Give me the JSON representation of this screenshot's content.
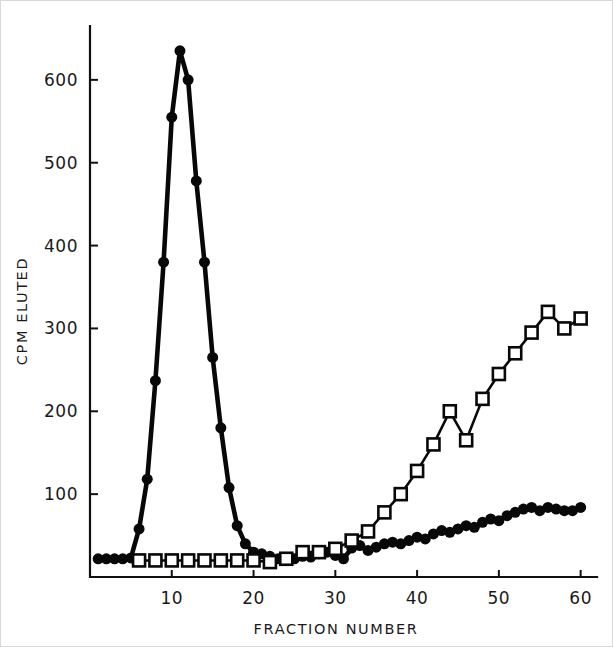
{
  "figure": {
    "background_color": "#ffffff",
    "ink_color": "#080808",
    "width": 613,
    "height": 647
  },
  "chart_data": {
    "type": "line",
    "title": "",
    "xlabel": "FRACTION NUMBER",
    "ylabel": "CPM ELUTED",
    "xlim": [
      0,
      62
    ],
    "ylim": [
      0,
      665
    ],
    "xticks": [
      10,
      20,
      30,
      40,
      50,
      60
    ],
    "xtick_labels": [
      "10",
      "20",
      "30",
      "40",
      "50",
      "60"
    ],
    "yticks": [
      100,
      200,
      300,
      400,
      500,
      600
    ],
    "ytick_labels": [
      "100",
      "200",
      "300",
      "400",
      "500",
      "600"
    ],
    "grid": false,
    "legend": "none",
    "series": [
      {
        "name": "filled-circles",
        "marker": "filled-circle",
        "marker_size": 11,
        "line_width": 4.6,
        "x": [
          1,
          2,
          3,
          4,
          5,
          6,
          7,
          8,
          9,
          10,
          11,
          12,
          13,
          14,
          15,
          16,
          17,
          18,
          19,
          20,
          21,
          22,
          23,
          24,
          25,
          26,
          27,
          28,
          29,
          30,
          31,
          32,
          33,
          34,
          35,
          36,
          37,
          38,
          39,
          40,
          41,
          42,
          43,
          44,
          45,
          46,
          47,
          48,
          49,
          50,
          51,
          52,
          53,
          54,
          55,
          56,
          57,
          58,
          59,
          60
        ],
        "values": [
          22,
          22,
          22,
          22,
          23,
          58,
          118,
          237,
          380,
          555,
          635,
          600,
          478,
          380,
          265,
          180,
          108,
          62,
          40,
          30,
          28,
          25,
          22,
          20,
          22,
          25,
          24,
          28,
          30,
          26,
          22,
          35,
          38,
          32,
          36,
          40,
          42,
          40,
          44,
          48,
          46,
          52,
          56,
          54,
          58,
          62,
          60,
          66,
          70,
          68,
          74,
          78,
          82,
          84,
          80,
          84,
          82,
          80,
          80,
          84
        ]
      },
      {
        "name": "open-squares",
        "marker": "open-square",
        "marker_size": 12,
        "line_width": 2.6,
        "x": [
          6,
          8,
          10,
          12,
          14,
          16,
          18,
          20,
          22,
          24,
          26,
          28,
          30,
          32,
          34,
          36,
          38,
          40,
          42,
          44,
          46,
          48,
          50,
          52,
          54,
          56,
          58,
          60
        ],
        "values": [
          20,
          20,
          20,
          20,
          20,
          20,
          20,
          20,
          18,
          22,
          30,
          30,
          34,
          44,
          55,
          78,
          100,
          128,
          160,
          200,
          165,
          215,
          245,
          270,
          295,
          320,
          300,
          312
        ]
      }
    ]
  }
}
